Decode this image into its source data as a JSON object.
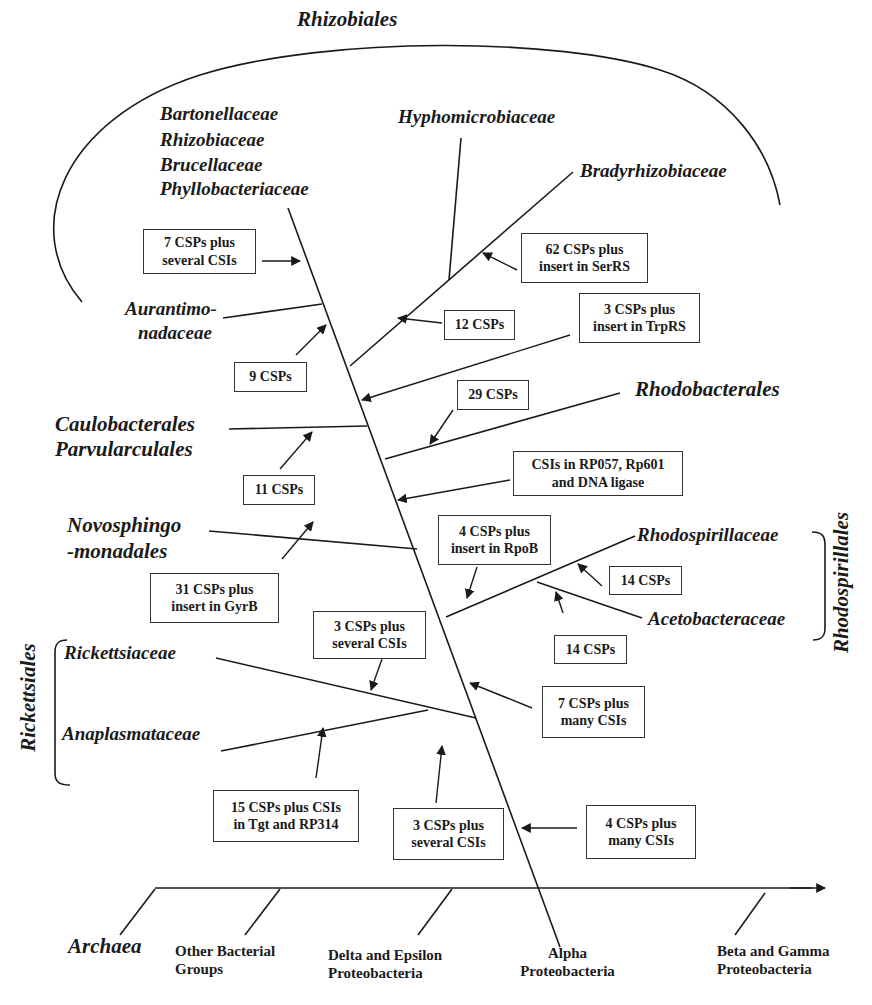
{
  "diagram": {
    "type": "phylogenetic-fishbone",
    "axis": {
      "groups": [
        {
          "label": "Archaea",
          "italic": true
        },
        {
          "label_line1": "Other Bacterial",
          "label_line2": "Groups"
        },
        {
          "label_line1": "Delta and Epsilon",
          "label_line2": "Proteobacteria"
        },
        {
          "label_line1": "Alpha",
          "label_line2": "Proteobacteria"
        },
        {
          "label_line1": "Beta and Gamma",
          "label_line2": "Proteobacteria"
        }
      ]
    },
    "clades": {
      "rhizobiales": "Rhizobiales",
      "bartonellaceae": "Bartonellaceae",
      "rhizobiaceae": "Rhizobiaceae",
      "brucellaceae": "Brucellaceae",
      "phyllobacteriaceae": "Phyllobacteriaceae",
      "hyphomicrobiaceae": "Hyphomicrobiaceae",
      "bradyrhizobiaceae": "Bradyrhizobiaceae",
      "aurantimo_1": "Aurantimo-",
      "aurantimo_2": "nadaceae",
      "caulobacterales": "Caulobacterales",
      "parvularculales": "Parvularculales",
      "rhodobacterales": "Rhodobacterales",
      "novosphingo_1": "Novosphingo",
      "novosphingo_2": "-monadales",
      "rhodospirillaceae": "Rhodospirillaceae",
      "acetobacteraceae": "Acetobacteraceae",
      "rhodospirillales": "Rhodospirillales",
      "rickettsiaceae": "Rickettsiaceae",
      "anaplasmataceae": "Anaplasmataceae",
      "rickettsiales": "Rickettsiales"
    },
    "annotations": [
      {
        "id": "a1",
        "line1": "7 CSPs plus",
        "line2": "several CSIs"
      },
      {
        "id": "a2",
        "line1": "62 CSPs plus",
        "line2": "insert in SerRS"
      },
      {
        "id": "a3",
        "line1": "12 CSPs"
      },
      {
        "id": "a4",
        "line1": "3 CSPs plus",
        "line2": "insert in TrpRS"
      },
      {
        "id": "a5",
        "line1": "9 CSPs"
      },
      {
        "id": "a6",
        "line1": "29 CSPs"
      },
      {
        "id": "a7",
        "line1": "11 CSPs"
      },
      {
        "id": "a8",
        "line1": "CSIs in RP057, Rp601",
        "line2": "and DNA ligase"
      },
      {
        "id": "a9",
        "line1": "4 CSPs plus",
        "line2": "insert in RpoB"
      },
      {
        "id": "a10",
        "line1": "14 CSPs"
      },
      {
        "id": "a11",
        "line1": "31 CSPs  plus",
        "line2": "insert in GyrB"
      },
      {
        "id": "a12",
        "line1": "14 CSPs"
      },
      {
        "id": "a13",
        "line1": "3 CSPs plus",
        "line2": "several CSIs"
      },
      {
        "id": "a14",
        "line1": "7 CSPs plus",
        "line2": "many CSIs"
      },
      {
        "id": "a15",
        "line1": "15 CSPs plus CSIs",
        "line2": "in Tgt and RP314"
      },
      {
        "id": "a16",
        "line1": "3 CSPs plus",
        "line2": "several CSIs"
      },
      {
        "id": "a17",
        "line1": "4 CSPs plus",
        "line2": "many CSIs"
      }
    ],
    "colors": {
      "ink": "#1a1a1a",
      "background": "#ffffff"
    }
  }
}
